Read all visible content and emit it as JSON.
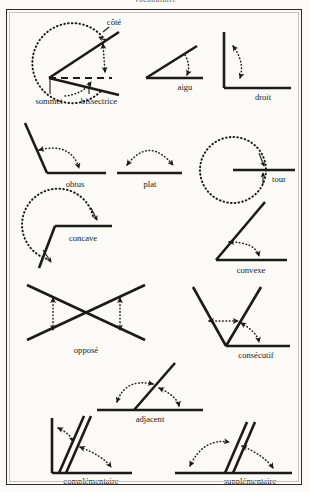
{
  "page": {
    "title_partial": "Vocabulaire",
    "background_color": "#fbfaf7",
    "ink_color": "#1b1b1b",
    "border_color": "#2b2b2b"
  },
  "diagram": {
    "type": "geometry-figure-sheet",
    "language": "fr",
    "figure_count": 13
  },
  "figures": [
    {
      "id": "angle-parts",
      "row": 1,
      "labels": [
        "côté",
        "sommet",
        "bissectrice"
      ],
      "label_cote": "côté",
      "label_sommet": "sommet",
      "label_bissectrice": "bissectrice",
      "description": "Angle réflexe avec arc pointillé, côtés, sommet et bissectrice en tirets"
    },
    {
      "id": "aigu",
      "row": 1,
      "label": "aigu",
      "description": "Angle aigu avec arc fléché"
    },
    {
      "id": "droit",
      "row": 1,
      "label": "droit",
      "description": "Angle droit 90 degrés"
    },
    {
      "id": "obtus",
      "row": 2,
      "label": "obtus",
      "description": "Angle obtus"
    },
    {
      "id": "plat",
      "row": 2,
      "label": "plat",
      "description": "Angle plat 180 degrés"
    },
    {
      "id": "tour",
      "row": 2,
      "label": "tour",
      "description": "Angle plein, tour complet 360 degrés"
    },
    {
      "id": "concave",
      "row": 3,
      "label": "concave",
      "description": "Angle concave rentrant"
    },
    {
      "id": "convexe",
      "row": 3,
      "label": "convexe",
      "description": "Angle convexe saillant"
    },
    {
      "id": "oppose",
      "row": 4,
      "label": "opposé",
      "description": "Angles opposés par le sommet, deux droites sécantes"
    },
    {
      "id": "consecutif",
      "row": 4,
      "label": "consécutif",
      "description": "Angles consécutifs partageant un côté"
    },
    {
      "id": "adjacent",
      "row": 5,
      "label": "adjacent",
      "description": "Angles adjacents"
    },
    {
      "id": "complementaire",
      "row": 6,
      "label": "complémentaire",
      "description": "Angles complémentaires, somme 90 degrés"
    },
    {
      "id": "supplementaire",
      "row": 6,
      "label": "supplémentaire",
      "description": "Angles supplémentaires, somme 180 degrés"
    }
  ]
}
